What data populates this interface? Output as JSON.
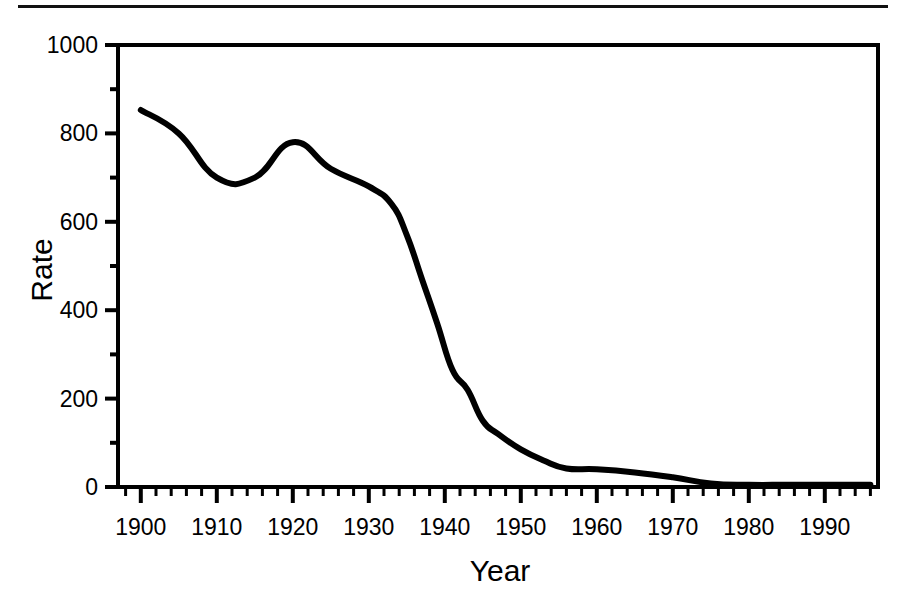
{
  "figure": {
    "has_top_rule": true,
    "background_color": "#ffffff",
    "line_color": "#000000",
    "frame_color": "#000000"
  },
  "chart_data": {
    "type": "line",
    "title": "",
    "subtitle": "",
    "xlabel": "Year",
    "ylabel": "Rate",
    "xlim": [
      1897,
      1997
    ],
    "ylim": [
      0,
      1000
    ],
    "grid": false,
    "legend": null,
    "legend_position": "none",
    "x_tick_labels": [
      "1900",
      "1910",
      "1920",
      "1930",
      "1940",
      "1950",
      "1960",
      "1970",
      "1980",
      "1990"
    ],
    "x_tick_values": [
      1900,
      1910,
      1920,
      1930,
      1940,
      1950,
      1960,
      1970,
      1980,
      1990
    ],
    "x_minor_tick_interval": 2,
    "y_tick_labels": [
      "0",
      "200",
      "400",
      "600",
      "800",
      "1000"
    ],
    "y_tick_values": [
      0,
      200,
      400,
      600,
      800,
      1000
    ],
    "y_minor_tick_interval": 100,
    "series": [
      {
        "name": "Rate",
        "color": "#000000",
        "line_width": 6,
        "x": [
          1900,
          1905,
          1910,
          1915,
          1920,
          1925,
          1930,
          1933,
          1935,
          1937,
          1939,
          1941,
          1943,
          1945,
          1947,
          1950,
          1953,
          1956,
          1960,
          1965,
          1970,
          1975,
          1980,
          1985,
          1990,
          1996
        ],
        "values": [
          853,
          800,
          700,
          700,
          780,
          720,
          680,
          640,
          570,
          470,
          370,
          265,
          220,
          150,
          120,
          85,
          60,
          42,
          40,
          33,
          22,
          8,
          5,
          5,
          5,
          5
        ]
      }
    ]
  }
}
